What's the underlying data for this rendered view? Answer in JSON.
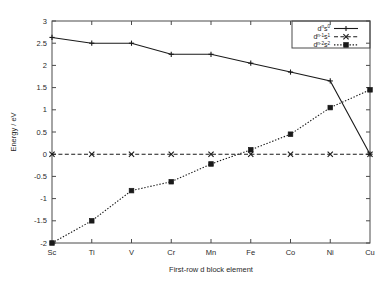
{
  "chart_data": {
    "type": "line",
    "title": "",
    "xlabel": "First-row d block element",
    "ylabel": "Energy / eV",
    "categories": [
      "Sc",
      "Ti",
      "V",
      "Cr",
      "Mn",
      "Fe",
      "Co",
      "Ni",
      "Cu"
    ],
    "xlim": [
      0,
      8
    ],
    "ylim": [
      -2,
      3
    ],
    "ytick_labels": [
      "-2",
      "-1.5",
      "-1",
      "-0.5",
      "0",
      "0.5",
      "1",
      "1.5",
      "2",
      "2.5",
      "3"
    ],
    "ytick_values": [
      -2,
      -1.5,
      -1,
      -0.5,
      0,
      0.5,
      1,
      1.5,
      2,
      2.5,
      3
    ],
    "grid": false,
    "legend_position": "top-right",
    "series": [
      {
        "name": "d^n s^0",
        "label_base": "d",
        "label_sup1": "n",
        "label_mid": "s",
        "label_sup2": "0",
        "linestyle": "solid",
        "marker": "plus",
        "color": "#1a1a1a",
        "values": [
          2.63,
          2.5,
          2.5,
          2.25,
          2.25,
          2.05,
          1.85,
          1.65,
          0.0
        ]
      },
      {
        "name": "d^(n-1) s^1",
        "label_base": "d",
        "label_sup1": "n-1",
        "label_mid": "s",
        "label_sup2": "1",
        "linestyle": "dashed",
        "marker": "cross",
        "color": "#1a1a1a",
        "values": [
          0.0,
          0.0,
          0.0,
          0.0,
          0.0,
          0.0,
          0.0,
          0.0,
          0.0
        ]
      },
      {
        "name": "d^(n-2) s^2",
        "label_base": "d",
        "label_sup1": "n-2",
        "label_mid": "s",
        "label_sup2": "2",
        "linestyle": "dotted",
        "marker": "square",
        "color": "#1a1a1a",
        "values": [
          -2.0,
          -1.5,
          -0.82,
          -0.62,
          -0.22,
          0.1,
          0.45,
          1.05,
          1.45
        ]
      }
    ]
  }
}
